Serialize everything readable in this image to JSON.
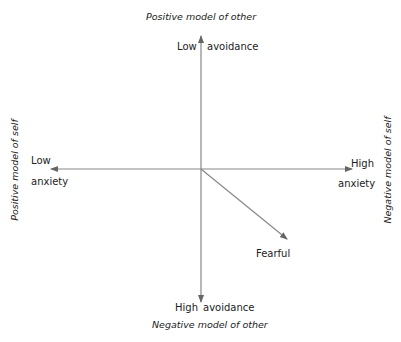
{
  "diagram": {
    "type": "two-dimensional attachment model",
    "axes": {
      "top": {
        "outer_label": "Positive model of other",
        "left_label": "Low",
        "right_label": "avoidance"
      },
      "bottom": {
        "outer_label": "Negative model of other",
        "left_label": "High",
        "right_label": "avoidance"
      },
      "left": {
        "outer_label": "Positive model of self",
        "top_label": "Low",
        "bottom_label": "anxiety"
      },
      "right": {
        "outer_label": "Negative model of self",
        "top_label": "High",
        "bottom_label": "anxiety"
      }
    },
    "vector": {
      "label": "Fearful",
      "direction": "high anxiety, high avoidance"
    },
    "colors": {
      "line": "#888888",
      "text": "#222222"
    }
  }
}
